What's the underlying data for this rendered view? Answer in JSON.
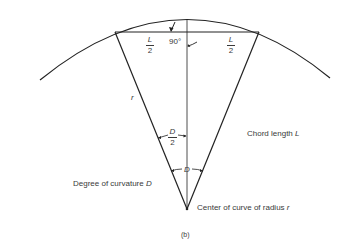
{
  "figure": {
    "caption": "(b)",
    "labels": {
      "half_chord_left": {
        "num": "L",
        "den": "2"
      },
      "half_chord_right": {
        "num": "L",
        "den": "2"
      },
      "right_angle": "90°",
      "radius": "r",
      "half_angle": {
        "num": "D",
        "den": "2"
      },
      "full_angle": "D",
      "chord_length_text": "Chord length ",
      "chord_length_var": "L",
      "degree_text": "Degree of curvature ",
      "degree_var": "D",
      "center_text": "Center of curve of radius ",
      "center_var": "r"
    },
    "colors": {
      "line": "#222222",
      "text": "#3a3a3a"
    }
  }
}
